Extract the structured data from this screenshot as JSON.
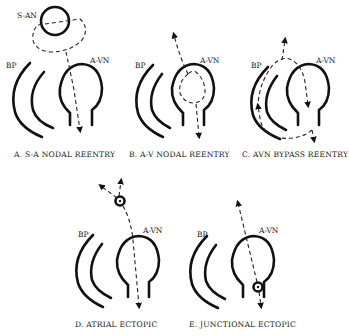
{
  "labels": {
    "bp": "BP",
    "avn": "A-VN",
    "san": "S-AN"
  },
  "panels": [
    {
      "id": "A",
      "caption": "A. S-A NODAL REENTRY"
    },
    {
      "id": "B",
      "caption": "B. A-V NODAL REENTRY"
    },
    {
      "id": "C",
      "caption": "C. AVN BYPASS REENTRY"
    },
    {
      "id": "D",
      "caption": "D. ATRIAL ECTOPIC"
    },
    {
      "id": "E",
      "caption": "E. JUNCTIONAL ECTOPIC"
    }
  ],
  "icons": {
    "ectopic_focus": "ectopic-focus-star-icon",
    "arrow": "arrow-icon"
  },
  "colors": {
    "ink": "#111111",
    "background": "#ffffff"
  }
}
